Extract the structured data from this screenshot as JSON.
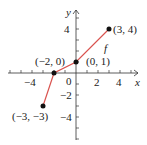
{
  "chart_data": {
    "type": "line",
    "title": "",
    "xlabel": "x",
    "ylabel": "y",
    "function_label": "f",
    "xlim": [
      -6,
      6
    ],
    "ylim": [
      -6,
      6
    ],
    "x_ticks": [
      -4,
      -2,
      0,
      2,
      4
    ],
    "x_tick_labels": [
      "-4",
      "0",
      "2",
      "4"
    ],
    "y_tick_labels": [
      "4",
      "-2",
      "-4"
    ],
    "origin_label": "0",
    "series": [
      {
        "name": "f",
        "x": [
          -3,
          -2,
          0,
          3
        ],
        "y": [
          -3,
          0,
          1,
          4
        ],
        "color": "#d9534f"
      }
    ],
    "points": [
      {
        "x": -3,
        "y": -3,
        "label": "(−3, −3)"
      },
      {
        "x": -2,
        "y": 0,
        "label": "(−2, 0)"
      },
      {
        "x": 0,
        "y": 1,
        "label": "(0, 1)"
      },
      {
        "x": 3,
        "y": 4,
        "label": "(3, 4)"
      }
    ],
    "grid": false
  }
}
